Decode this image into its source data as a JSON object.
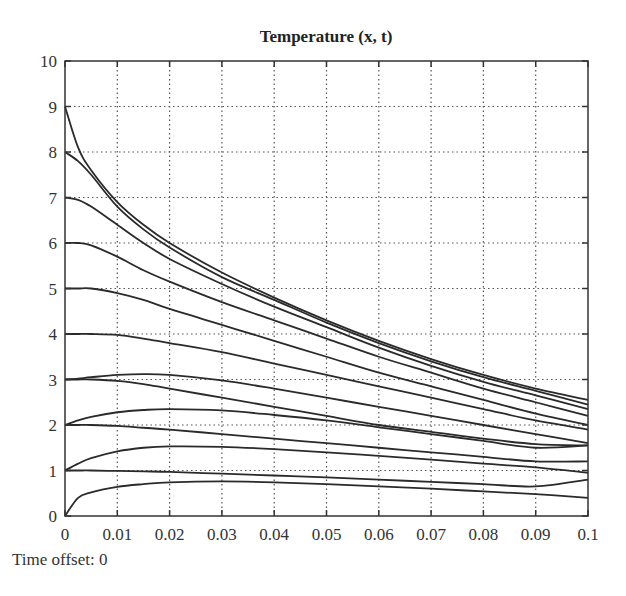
{
  "chart_data": {
    "type": "line",
    "title": "Temperature (x, t)",
    "xlabel": "",
    "ylabel": "",
    "xlim": [
      0,
      0.1
    ],
    "ylim": [
      0,
      10
    ],
    "grid": true,
    "grid_style": "dotted",
    "legend": null,
    "x_ticks": [
      "0",
      "0.01",
      "0.02",
      "0.03",
      "0.04",
      "0.05",
      "0.06",
      "0.07",
      "0.08",
      "0.09",
      "0.1"
    ],
    "y_ticks": [
      "0",
      "1",
      "2",
      "3",
      "4",
      "5",
      "6",
      "7",
      "8",
      "9",
      "10"
    ],
    "x": [
      0,
      0.0025,
      0.005,
      0.01,
      0.015,
      0.02,
      0.03,
      0.04,
      0.05,
      0.06,
      0.07,
      0.08,
      0.09,
      0.1
    ],
    "series": [
      {
        "name": "curve-9",
        "values": [
          9.0,
          8.1,
          7.6,
          6.9,
          6.4,
          6.0,
          5.35,
          4.8,
          4.3,
          3.85,
          3.45,
          3.1,
          2.8,
          2.55
        ]
      },
      {
        "name": "curve-8",
        "values": [
          8.0,
          7.8,
          7.5,
          6.8,
          6.3,
          5.9,
          5.25,
          4.75,
          4.25,
          3.8,
          3.4,
          3.05,
          2.75,
          2.45
        ]
      },
      {
        "name": "curve-7",
        "values": [
          7.0,
          6.95,
          6.8,
          6.4,
          6.0,
          5.65,
          5.1,
          4.6,
          4.15,
          3.7,
          3.3,
          2.95,
          2.65,
          2.35
        ]
      },
      {
        "name": "curve-6",
        "values": [
          6.0,
          6.0,
          5.95,
          5.7,
          5.4,
          5.15,
          4.7,
          4.3,
          3.9,
          3.5,
          3.15,
          2.8,
          2.5,
          2.2
        ]
      },
      {
        "name": "curve-5",
        "values": [
          5.0,
          5.0,
          5.0,
          4.9,
          4.75,
          4.55,
          4.2,
          3.85,
          3.5,
          3.15,
          2.85,
          2.55,
          2.25,
          2.0
        ]
      },
      {
        "name": "curve-4",
        "values": [
          4.0,
          4.0,
          4.0,
          3.98,
          3.9,
          3.8,
          3.6,
          3.35,
          3.1,
          2.85,
          2.6,
          2.35,
          2.1,
          1.9
        ]
      },
      {
        "name": "curve-3",
        "values": [
          3.0,
          3.02,
          3.05,
          3.1,
          3.12,
          3.1,
          2.98,
          2.8,
          2.6,
          2.4,
          2.2,
          2.0,
          1.8,
          1.6
        ]
      },
      {
        "name": "curve-3b",
        "values": [
          3.0,
          3.0,
          3.0,
          2.97,
          2.9,
          2.8,
          2.6,
          2.4,
          2.2,
          2.0,
          1.85,
          1.7,
          1.58,
          1.55
        ]
      },
      {
        "name": "curve-2",
        "values": [
          2.0,
          2.1,
          2.18,
          2.28,
          2.33,
          2.35,
          2.32,
          2.22,
          2.1,
          1.95,
          1.8,
          1.65,
          1.5,
          1.55
        ]
      },
      {
        "name": "curve-2b",
        "values": [
          2.0,
          2.0,
          2.0,
          1.98,
          1.94,
          1.9,
          1.8,
          1.7,
          1.6,
          1.5,
          1.4,
          1.3,
          1.2,
          1.2
        ]
      },
      {
        "name": "curve-1",
        "values": [
          1.0,
          1.15,
          1.27,
          1.42,
          1.5,
          1.53,
          1.52,
          1.47,
          1.4,
          1.32,
          1.24,
          1.15,
          1.07,
          0.95
        ]
      },
      {
        "name": "curve-1b",
        "values": [
          1.0,
          1.0,
          1.0,
          0.99,
          0.98,
          0.97,
          0.93,
          0.89,
          0.85,
          0.8,
          0.75,
          0.7,
          0.65,
          0.8
        ]
      },
      {
        "name": "curve-0",
        "values": [
          0.0,
          0.4,
          0.52,
          0.64,
          0.7,
          0.74,
          0.76,
          0.74,
          0.7,
          0.65,
          0.6,
          0.54,
          0.48,
          0.4
        ]
      }
    ]
  },
  "footer": {
    "time_offset_label": "Time offset: 0"
  },
  "style": {
    "line_color": "#2a2a2a",
    "grid_color": "#555555",
    "frame_color": "#333333",
    "background": "#ffffff"
  }
}
